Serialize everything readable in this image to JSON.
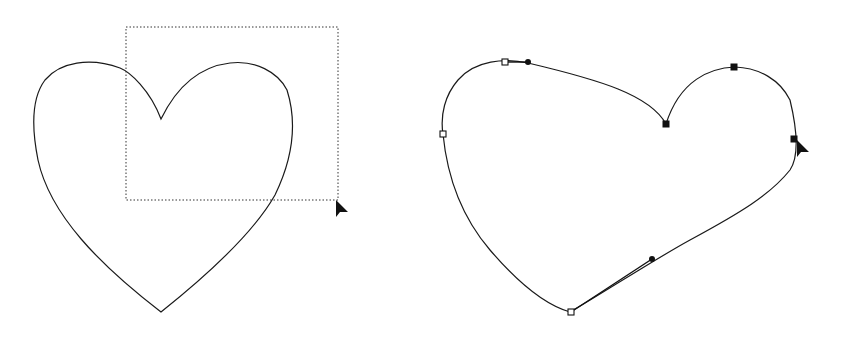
{
  "canvas": {
    "width": 844,
    "height": 339,
    "background": "#ffffff"
  },
  "left_panel": {
    "heart_path": "M161,119 C150,90 130,72 120,68 C90,57 60,62 45,80 C30,100 33,135 38,160 C50,215 100,265 161,312 C220,265 258,225 275,195 C292,160 298,125 287,90 C278,72 255,60 230,63 C205,66 180,80 161,119 Z",
    "selection_rect": {
      "x": 126,
      "y": 27,
      "width": 212,
      "height": 173
    },
    "cursor": {
      "x": 336,
      "y": 200
    }
  },
  "right_panel": {
    "heart_path": "M666,124 C650,95 600,80 528,63 C505,58 475,60 458,80 C445,95 440,115 443,134 C447,175 460,215 490,250 C520,285 545,305 570,312 C600,295 650,262 690,240 C740,213 770,195 790,170 C800,155 796,125 790,100 C780,80 760,68 735,67 C710,68 680,80 666,124 Z",
    "anchors": [
      {
        "name": "top-left-hollow",
        "x": 505,
        "y": 62,
        "type": "hollow"
      },
      {
        "name": "left-hollow",
        "x": 443,
        "y": 134,
        "type": "hollow"
      },
      {
        "name": "bottom-hollow",
        "x": 571,
        "y": 312,
        "type": "hollow"
      },
      {
        "name": "cleft-solid",
        "x": 666,
        "y": 124,
        "type": "solid"
      },
      {
        "name": "top-right-solid",
        "x": 734,
        "y": 67,
        "type": "solid"
      },
      {
        "name": "right-solid",
        "x": 794,
        "y": 139,
        "type": "solid"
      }
    ],
    "handles": [
      {
        "from": [
          505,
          62
        ],
        "to": [
          528,
          62
        ]
      },
      {
        "from": [
          571,
          312
        ],
        "to": [
          652,
          259
        ]
      }
    ],
    "cursor": {
      "x": 797,
      "y": 140
    }
  }
}
